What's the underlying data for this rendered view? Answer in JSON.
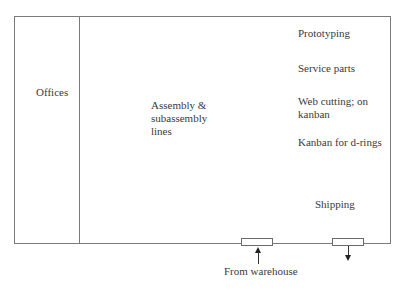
{
  "diagram": {
    "type": "floor-plan",
    "zones": {
      "offices": "Offices",
      "assembly": [
        "Assembly &",
        "subassembly",
        "lines"
      ],
      "prototyping": "Prototyping",
      "service_parts": "Service parts",
      "web_cutting": [
        "Web cutting; on",
        "kanban"
      ],
      "kanban_drings": "Kanban for d-rings",
      "shipping": "Shipping"
    },
    "doors": {
      "inbound_label": "From warehouse"
    },
    "colors": {
      "wall": "#7a7a7a",
      "text": "#3a3a3a",
      "arrow": "#222222"
    }
  }
}
